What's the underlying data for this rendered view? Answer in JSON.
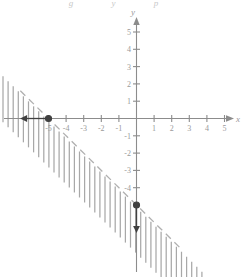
{
  "figure": {
    "title_cut": "g  y  p",
    "background_color": "#ffffff",
    "axis_color": "#8c8c8c",
    "boundary_color": "#b0b0b0",
    "hatch_color": "#a8a8a8",
    "point_color": "#404040",
    "label_color": "#9a9a9a"
  },
  "chart_data": {
    "type": "line",
    "title": "",
    "subtitle": "",
    "xlabel": "x",
    "ylabel": "y",
    "xlim": [
      -6.6,
      6.0
    ],
    "ylim": [
      -7.6,
      6.0
    ],
    "grid": false,
    "legend": null,
    "x_ticks": [
      -5,
      -4,
      -3,
      -2,
      -1,
      1,
      2,
      3,
      4,
      5
    ],
    "x_tick_labels": [
      "-5",
      "-4",
      "-3",
      "-2",
      "-1",
      "1",
      "2",
      "3",
      "4",
      "5"
    ],
    "y_ticks": [
      -4,
      -3,
      -2,
      -1,
      1,
      2,
      3,
      4,
      5
    ],
    "y_tick_labels": [
      "-4",
      "-3",
      "-2",
      "-1",
      "1",
      "2",
      "3",
      "4",
      "5"
    ],
    "series": [
      {
        "name": "boundary",
        "kind": "dashed-line",
        "equation": "y = -x - 5",
        "slope": -1,
        "intercept": -5,
        "style": "dashed",
        "x": [
          -6.6,
          2.6
        ],
        "y": [
          1.6,
          -7.6
        ]
      },
      {
        "name": "shaded-region",
        "kind": "hatch-below",
        "description": "vertical hatch lines below the dashed boundary line",
        "inequality": "y < -x - 5"
      }
    ],
    "points": [
      {
        "name": "x-intercept",
        "x": -5,
        "y": 0,
        "marker": "filled-circle"
      },
      {
        "name": "y-intercept",
        "x": 0,
        "y": -5,
        "marker": "filled-circle"
      }
    ],
    "annotations": [
      {
        "name": "left-arrow",
        "from": [
          -5,
          0
        ],
        "to": [
          -6.3,
          0
        ],
        "direction": "left"
      },
      {
        "name": "down-arrow",
        "from": [
          0,
          -5
        ],
        "to": [
          0,
          -6.3
        ],
        "direction": "down"
      }
    ],
    "axis_arrows": [
      "x-positive",
      "y-positive"
    ]
  }
}
